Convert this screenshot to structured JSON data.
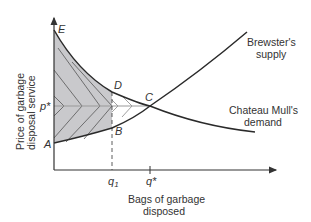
{
  "diagram": {
    "type": "supply-demand",
    "y_axis_label": [
      "Price of garbage",
      "disposal service"
    ],
    "x_axis_label": [
      "Bags of garbage",
      "disposed"
    ],
    "curves": {
      "supply": {
        "label": [
          "Brewster's",
          "supply"
        ]
      },
      "demand": {
        "label": [
          "Chateau Mull's",
          "demand"
        ]
      }
    },
    "points": {
      "E": "E",
      "D": "D",
      "C": "C",
      "B": "B",
      "A": "A"
    },
    "price_label": "p*",
    "quantity_labels": {
      "q1": "q",
      "q1_sub": "1",
      "qstar": "q*"
    },
    "colors": {
      "shade": "#c9c9cc",
      "curve": "#2a2a2a",
      "axis": "#333333",
      "hatch": "#555555",
      "arrow_line": "#999999"
    }
  }
}
